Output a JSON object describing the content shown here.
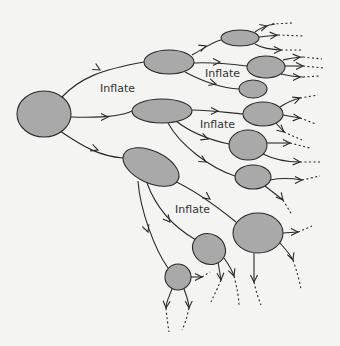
{
  "diagram": {
    "title": "",
    "background": "#f4f4f2",
    "node_fill": "#a9a9a9",
    "stroke_color": "#2a2a2a",
    "labels": [
      {
        "id": "inflate-1",
        "text": "Inflate",
        "x": 100,
        "y": 92
      },
      {
        "id": "inflate-2",
        "text": "Inflate",
        "x": 205,
        "y": 77
      },
      {
        "id": "inflate-3",
        "text": "Inflate",
        "x": 200,
        "y": 128
      },
      {
        "id": "inflate-4",
        "text": "Inflate",
        "x": 175,
        "y": 213
      }
    ],
    "nodes": [
      {
        "id": "root",
        "cx": 44,
        "cy": 114,
        "rx": 27,
        "ry": 23,
        "rot": 0
      },
      {
        "id": "n-upper",
        "cx": 169,
        "cy": 62,
        "rx": 25,
        "ry": 12,
        "rot": 0
      },
      {
        "id": "n-middle",
        "cx": 162,
        "cy": 111,
        "rx": 30,
        "ry": 12,
        "rot": 0
      },
      {
        "id": "n-lower",
        "cx": 151,
        "cy": 167,
        "rx": 30,
        "ry": 16,
        "rot": 25
      },
      {
        "id": "n-top-right",
        "cx": 240,
        "cy": 38,
        "rx": 19,
        "ry": 8,
        "rot": 0
      },
      {
        "id": "n-upper-right",
        "cx": 266,
        "cy": 67,
        "rx": 19,
        "ry": 11,
        "rot": 0
      },
      {
        "id": "n-small-right",
        "cx": 253,
        "cy": 89,
        "rx": 14,
        "ry": 9,
        "rot": 0
      },
      {
        "id": "n-mid-right-1",
        "cx": 263,
        "cy": 114,
        "rx": 20,
        "ry": 12,
        "rot": 0
      },
      {
        "id": "n-mid-right-2",
        "cx": 248,
        "cy": 145,
        "rx": 19,
        "ry": 15,
        "rot": 0
      },
      {
        "id": "n-mid-right-3",
        "cx": 253,
        "cy": 177,
        "rx": 18,
        "ry": 12,
        "rot": 0
      },
      {
        "id": "n-big-right",
        "cx": 258,
        "cy": 233,
        "rx": 25,
        "ry": 20,
        "rot": 0
      },
      {
        "id": "n-low-mid",
        "cx": 209,
        "cy": 249,
        "rx": 17,
        "ry": 15,
        "rot": 30
      },
      {
        "id": "n-small-bottom",
        "cx": 178,
        "cy": 277,
        "rx": 13,
        "ry": 13,
        "rot": 0
      }
    ],
    "edges": [
      {
        "d": "M62,97 C80,78 100,70 144,62",
        "arrow": [
          100,
          70,
          30
        ]
      },
      {
        "d": "M71,117 C100,118 120,117 132,111",
        "arrow": [
          108,
          117,
          0
        ]
      },
      {
        "d": "M60,131 C85,148 100,156 123,158",
        "arrow": [
          98,
          150,
          20
        ]
      },
      {
        "d": "M192,55 C205,48 212,42 221,40",
        "arrow": [
          206,
          46,
          -20
        ]
      },
      {
        "d": "M194,63 C210,62 230,64 247,66",
        "arrow": [
          220,
          62,
          0
        ]
      },
      {
        "d": "M185,72 C200,80 220,88 239,89",
        "arrow": [
          216,
          84,
          15
        ]
      },
      {
        "d": "M192,110 C210,110 230,113 243,114",
        "arrow": [
          218,
          111,
          0
        ]
      },
      {
        "d": "M176,121 C190,132 210,140 229,144",
        "arrow": [
          208,
          139,
          20
        ]
      },
      {
        "d": "M168,123 C180,145 210,168 235,176",
        "arrow": [
          206,
          162,
          30
        ]
      },
      {
        "d": "M172,180 C195,190 215,205 236,222",
        "arrow": [
          210,
          199,
          35
        ]
      },
      {
        "d": "M147,183 C155,205 170,225 196,240",
        "arrow": [
          170,
          222,
          50
        ]
      },
      {
        "d": "M138,181 C140,210 155,250 168,268",
        "arrow": [
          148,
          232,
          70
        ]
      }
    ],
    "tails": [
      {
        "d": "M255,32 C262,27 268,25 275,24",
        "arrow": [
          267,
          26,
          -15
        ],
        "dash": "M272,24 L293,23"
      },
      {
        "d": "M259,37 L278,35",
        "arrow": [
          277,
          35,
          -5
        ],
        "dash": "M278,35 L303,36"
      },
      {
        "d": "M255,44 C262,48 268,49 281,50",
        "arrow": [
          281,
          50,
          0
        ],
        "dash": "M281,50 L303,50"
      },
      {
        "d": "M283,60 C292,58 296,57 303,57",
        "arrow": [
          300,
          57,
          -5
        ],
        "dash": "M303,57 L322,59"
      },
      {
        "d": "M285,66 L303,66",
        "arrow": [
          303,
          66,
          0
        ],
        "dash": "M303,66 L324,68"
      },
      {
        "d": "M281,74 C290,76 296,77 303,77",
        "arrow": [
          300,
          77,
          0
        ],
        "dash": "M303,77 L320,76"
      },
      {
        "d": "M280,107 C286,103 292,100 300,98",
        "arrow": [
          300,
          98,
          -20
        ],
        "dash": "M300,98 L318,95"
      },
      {
        "d": "M283,115 L300,118",
        "arrow": [
          300,
          118,
          5
        ],
        "dash": "M300,118 L316,124"
      },
      {
        "d": "M275,122 L284,132",
        "arrow": [
          284,
          132,
          40
        ],
        "dash": "M284,132 L302,140"
      },
      {
        "d": "M267,143 L290,143",
        "arrow": [
          290,
          143,
          0
        ],
        "dash": "M290,143 L310,148"
      },
      {
        "d": "M263,154 C275,160 290,162 300,162",
        "arrow": [
          300,
          162,
          5
        ],
        "dash": "M300,162 L322,162"
      },
      {
        "d": "M270,180 C280,178 290,178 302,180",
        "arrow": [
          302,
          180,
          0
        ],
        "dash": "M302,180 L320,176"
      },
      {
        "d": "M265,186 L283,200",
        "arrow": [
          283,
          200,
          50
        ],
        "dash": "M283,200 L292,215"
      },
      {
        "d": "M283,233 L298,232",
        "arrow": [
          298,
          232,
          0
        ],
        "dash": "M298,232 L312,226"
      },
      {
        "d": "M280,243 C288,252 292,258 293,260",
        "arrow": [
          293,
          260,
          70
        ],
        "dash": "M293,260 C297,272 300,282 301,290"
      },
      {
        "d": "M254,253 L254,282",
        "arrow": [
          254,
          282,
          90
        ],
        "dash": "M254,282 C256,292 259,300 261,305"
      },
      {
        "d": "M218,262 L221,280",
        "arrow": [
          221,
          280,
          85
        ],
        "dash": "M221,280 C217,290 213,297 211,302"
      },
      {
        "d": "M224,258 C229,265 232,270 234,276",
        "arrow": [
          234,
          276,
          70
        ],
        "dash": "M234,276 C237,288 239,298 239,306"
      },
      {
        "d": "M191,277 L202,277",
        "arrow": [
          202,
          277,
          0
        ],
        "dash": "M202,277 L210,272"
      },
      {
        "d": "M172,289 C169,297 166,302 166,308",
        "arrow": [
          166,
          308,
          95
        ],
        "dash": "M166,308 C167,318 168,326 169,332"
      },
      {
        "d": "M184,289 C187,297 189,302 189,308",
        "arrow": [
          189,
          308,
          88
        ],
        "dash": "M189,308 C187,318 184,326 182,330"
      }
    ]
  }
}
